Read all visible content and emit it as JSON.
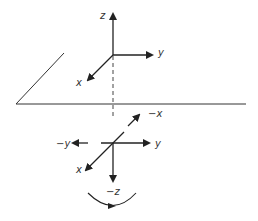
{
  "diagram": {
    "upper_axes": {
      "z": "z",
      "y": "y",
      "x": "x"
    },
    "lower_axes": {
      "neg_x": "−x",
      "neg_y": "−y",
      "y": "y",
      "x": "x",
      "neg_z": "−z"
    },
    "rotation_arrow": "rotation-arc",
    "colors": {
      "stroke": "#222222",
      "background": "#ffffff"
    }
  }
}
